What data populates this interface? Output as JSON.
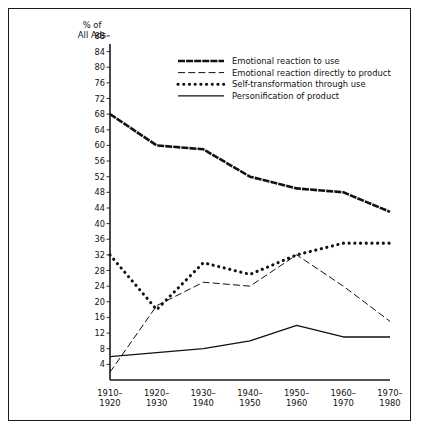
{
  "chart_data": {
    "type": "line",
    "title": "",
    "ylabel": "% of All Ads",
    "ylabel_line1": "% of",
    "ylabel_line2": "All Ads",
    "xlabel": "",
    "ylim": [
      0,
      90
    ],
    "ytick_values": [
      4,
      8,
      12,
      16,
      20,
      24,
      28,
      32,
      36,
      40,
      44,
      48,
      52,
      56,
      60,
      64,
      68,
      72,
      76,
      80,
      84,
      88
    ],
    "ytick_labels": [
      "4",
      "8",
      "12",
      "16",
      "20",
      "24",
      "28",
      "32",
      "36",
      "40",
      "44",
      "48",
      "52",
      "56",
      "60",
      "64",
      "68",
      "72",
      "76",
      "80",
      "84",
      "88"
    ],
    "grid": false,
    "legend_position": "upper-center",
    "categories": [
      "1910-1920",
      "1920-1930",
      "1930-1940",
      "1940-1950",
      "1950-1960",
      "1960-1970",
      "1970-1980"
    ],
    "xtick_labels_line1": [
      "1910–",
      "1920–",
      "1930–",
      "1940–",
      "1950–",
      "1960–",
      "1970–"
    ],
    "xtick_labels_line2": [
      "1920",
      "1930",
      "1940",
      "1950",
      "1960",
      "1970",
      "1980"
    ],
    "series": [
      {
        "name": "Emotional reaction to use",
        "style": "thick-dashed",
        "color": "#111111",
        "values": [
          68,
          60,
          59,
          52,
          49,
          48,
          43
        ]
      },
      {
        "name": "Emotional reaction directly to product",
        "style": "dashed",
        "color": "#111111",
        "values": [
          2,
          19,
          25,
          24,
          32,
          24,
          15
        ]
      },
      {
        "name": "Self-transformation through use",
        "style": "dotted",
        "color": "#111111",
        "values": [
          32,
          18,
          30,
          27,
          32,
          35,
          35
        ]
      },
      {
        "name": "Personification of product",
        "style": "solid",
        "color": "#111111",
        "values": [
          6,
          7,
          8,
          10,
          14,
          11,
          11
        ]
      }
    ]
  },
  "legend": {
    "items": [
      {
        "label": "Emotional reaction to use",
        "style": "thick-dashed"
      },
      {
        "label": "Emotional reaction directly to product",
        "style": "dashed"
      },
      {
        "label": "Self-transformation through use",
        "style": "dotted"
      },
      {
        "label": "Personification of product",
        "style": "solid"
      }
    ]
  }
}
